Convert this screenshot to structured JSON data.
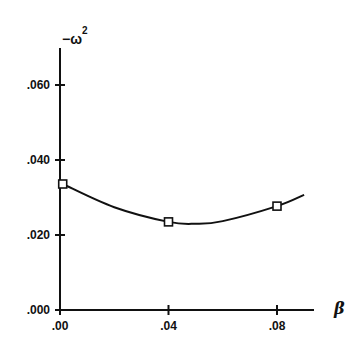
{
  "chart_data": {
    "type": "line",
    "title": "",
    "xlabel": "β",
    "ylabel": "−ω²",
    "ylabel_parts": {
      "prefix": "−ω",
      "superscript": "2"
    },
    "xlim": [
      0.0,
      0.09
    ],
    "ylim": [
      0.0,
      0.068
    ],
    "grid": false,
    "legend": null,
    "x_ticks": [
      {
        "value": 0.0,
        "label": ".00"
      },
      {
        "value": 0.04,
        "label": ".04"
      },
      {
        "value": 0.08,
        "label": ".08"
      }
    ],
    "y_ticks": [
      {
        "value": 0.0,
        "label": ".000"
      },
      {
        "value": 0.02,
        "label": ".020"
      },
      {
        "value": 0.04,
        "label": ".040"
      },
      {
        "value": 0.06,
        "label": ".060"
      }
    ],
    "series": [
      {
        "name": "−ω² vs β",
        "marker": "square",
        "points": [
          {
            "x": 0.001,
            "y": 0.0336
          },
          {
            "x": 0.04,
            "y": 0.0235
          },
          {
            "x": 0.08,
            "y": 0.0277
          }
        ],
        "fitted_curve": [
          {
            "x": 0.001,
            "y": 0.0336
          },
          {
            "x": 0.02,
            "y": 0.0274
          },
          {
            "x": 0.04,
            "y": 0.0235
          },
          {
            "x": 0.05,
            "y": 0.023
          },
          {
            "x": 0.06,
            "y": 0.0237
          },
          {
            "x": 0.08,
            "y": 0.0277
          },
          {
            "x": 0.09,
            "y": 0.0307
          }
        ]
      }
    ]
  }
}
